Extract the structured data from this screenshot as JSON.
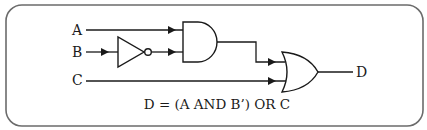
{
  "diagram": {
    "type": "logic-circuit",
    "inputs": [
      {
        "label": "A"
      },
      {
        "label": "B"
      },
      {
        "label": "C"
      }
    ],
    "output": {
      "label": "D"
    },
    "gates": [
      {
        "id": "not1",
        "type": "NOT",
        "inputs": [
          "B"
        ],
        "output": "B'"
      },
      {
        "id": "and1",
        "type": "AND",
        "inputs": [
          "A",
          "B'"
        ],
        "output": "A AND B'"
      },
      {
        "id": "or1",
        "type": "OR",
        "inputs": [
          "A AND B'",
          "C"
        ],
        "output": "D"
      }
    ],
    "equation": "D = (A AND B’) OR C"
  },
  "colors": {
    "frame": "#6b6b6b",
    "line": "#1a1a1a",
    "background": "#ffffff"
  }
}
